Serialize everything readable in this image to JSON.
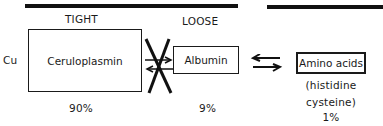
{
  "diagram": {
    "element": "Cu",
    "headers": {
      "tight": "TIGHT",
      "loose": "LOOSE"
    },
    "nodes": [
      {
        "id": "ceruloplasmin",
        "label": "Ceruloplasmin",
        "percent": "90%",
        "binding": "tight"
      },
      {
        "id": "albumin",
        "label": "Albumin",
        "percent": "9%",
        "binding": "loose"
      },
      {
        "id": "amino-acids",
        "label": "Amino acids",
        "sublabel_1": "(histidine",
        "sublabel_2": "cysteine)",
        "percent": "1%"
      }
    ],
    "edges": [
      {
        "from": "ceruloplasmin",
        "to": "albumin",
        "type": "reversible",
        "blocked": true
      },
      {
        "from": "albumin",
        "to": "amino-acids",
        "type": "reversible",
        "blocked": false
      }
    ]
  }
}
